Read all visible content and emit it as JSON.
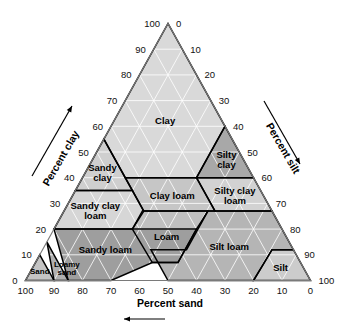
{
  "figure": {
    "background_color": "#ffffff"
  },
  "axes": {
    "bottom": {
      "title": "Percent sand",
      "direction": "left",
      "ticks": [
        "100",
        "90",
        "80",
        "70",
        "60",
        "50",
        "40",
        "30",
        "20",
        "10",
        "0"
      ]
    },
    "left": {
      "title": "Percent clay",
      "direction": "up-right",
      "ticks": [
        "0",
        "10",
        "20",
        "30",
        "40",
        "50",
        "60",
        "70",
        "80",
        "90",
        "100"
      ]
    },
    "right": {
      "title": "Percent silt",
      "direction": "down-right",
      "ticks": [
        "0",
        "10",
        "20",
        "30",
        "40",
        "50",
        "60",
        "70",
        "80",
        "90",
        "100"
      ]
    }
  },
  "chart_data": {
    "type": "diagram",
    "subtype": "ternary-soil-texture-triangle",
    "axis_titles": {
      "bottom": "Percent sand",
      "left": "Percent clay",
      "right": "Percent silt"
    },
    "axis_ranges": {
      "sand": [
        0,
        100
      ],
      "silt": [
        0,
        100
      ],
      "clay": [
        0,
        100
      ]
    },
    "tick_interval": 10,
    "grid": true,
    "legend": "none",
    "apex_labels": {
      "top_left": "100",
      "top_right": "0",
      "bottom_left": "0",
      "bottom_left_sand": "100",
      "bottom_right": "100",
      "bottom_right_sand": "0"
    },
    "regions": [
      {
        "name": "Clay",
        "label": "Clay",
        "fill": "#d9d9d9",
        "label_clay": 62,
        "label_sand": 20,
        "vertices_clay_sand": [
          [
            40,
            45
          ],
          [
            40,
            20
          ],
          [
            60,
            0
          ],
          [
            100,
            0
          ],
          [
            55,
            45
          ]
        ]
      },
      {
        "name": "Silty clay",
        "label": "Silty clay",
        "fill": "#a8a8a8",
        "label_clay": 47,
        "label_sand": 6,
        "vertices_clay_sand": [
          [
            40,
            0
          ],
          [
            40,
            20
          ],
          [
            60,
            0
          ]
        ]
      },
      {
        "name": "Sandy clay",
        "label": "Sandy clay",
        "fill": "#cfcfcf",
        "label_clay": 42,
        "label_sand": 52,
        "vertices_clay_sand": [
          [
            35,
            65
          ],
          [
            35,
            45
          ],
          [
            55,
            45
          ]
        ]
      },
      {
        "name": "Silty clay loam",
        "label": "Silty clay loam",
        "fill": "#d2d2d2",
        "label_clay": 33,
        "label_sand": 10,
        "vertices_clay_sand": [
          [
            27,
            0
          ],
          [
            27,
            20
          ],
          [
            40,
            20
          ],
          [
            40,
            0
          ]
        ]
      },
      {
        "name": "Clay loam",
        "label": "Clay loam",
        "fill": "#c6c6c6",
        "label_clay": 33,
        "label_sand": 32,
        "vertices_clay_sand": [
          [
            27,
            20
          ],
          [
            27,
            45
          ],
          [
            40,
            45
          ],
          [
            40,
            20
          ]
        ]
      },
      {
        "name": "Sandy clay loam",
        "label": "Sandy clay loam",
        "fill": "#d6d6d6",
        "label_clay": 27,
        "label_sand": 62,
        "vertices_clay_sand": [
          [
            20,
            80
          ],
          [
            20,
            52.5
          ],
          [
            27.5,
            45
          ],
          [
            35,
            45
          ],
          [
            35,
            65
          ]
        ]
      },
      {
        "name": "Silt loam",
        "label": "Silt loam",
        "fill": "#b5b5b5",
        "label_clay": 13,
        "label_sand": 22,
        "vertices_clay_sand": [
          [
            0,
            20
          ],
          [
            0,
            50
          ],
          [
            12,
            50
          ],
          [
            12,
            37.5
          ],
          [
            27,
            22.5
          ],
          [
            27,
            0
          ],
          [
            12,
            0
          ],
          [
            12,
            7.5
          ]
        ]
      },
      {
        "name": "Silt",
        "label": "Silt",
        "fill": "#cccccc",
        "label_clay": 5,
        "label_sand": 8,
        "vertices_clay_sand": [
          [
            0,
            0
          ],
          [
            0,
            20
          ],
          [
            12,
            7.5
          ],
          [
            12,
            0
          ]
        ]
      },
      {
        "name": "Loam",
        "label": "Loam",
        "fill": "#c0c0c0",
        "label_clay": 17,
        "label_sand": 42,
        "vertices_clay_sand": [
          [
            7,
            52
          ],
          [
            7,
            43
          ],
          [
            20,
            30
          ],
          [
            27,
            22.5
          ],
          [
            27,
            45
          ],
          [
            20,
            52.5
          ]
        ]
      },
      {
        "name": "Sandy loam",
        "label": "Sandy loam",
        "fill": "#9e9e9e",
        "label_clay": 12,
        "label_sand": 66,
        "vertices_clay_sand": [
          [
            0,
            85
          ],
          [
            0,
            70
          ],
          [
            7,
            52
          ],
          [
            7,
            43
          ],
          [
            20,
            30
          ],
          [
            20,
            52.5
          ],
          [
            20,
            80
          ]
        ]
      },
      {
        "name": "Loamy sand",
        "label": "Loamy sand",
        "label_lines": [
          "Loamy",
          "sand"
        ],
        "fill": "#b0b0b0",
        "label_clay": 5,
        "label_sand": 83,
        "vertices_clay_sand": [
          [
            0,
            85
          ],
          [
            0,
            90
          ],
          [
            15,
            85
          ],
          [
            10,
            85
          ]
        ]
      },
      {
        "name": "Sand",
        "label": "Sand",
        "fill": "#c4c4c4",
        "label_clay": 4,
        "label_sand": 93,
        "vertices_clay_sand": [
          [
            0,
            90
          ],
          [
            0,
            100
          ],
          [
            10,
            90
          ]
        ]
      }
    ]
  }
}
